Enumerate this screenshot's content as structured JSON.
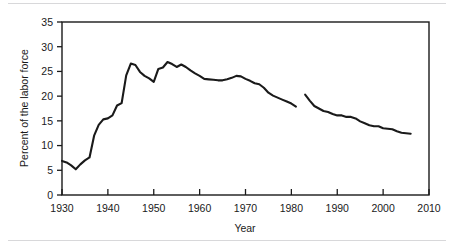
{
  "chart_data": {
    "type": "line",
    "title": "",
    "xlabel": "Year",
    "ylabel": "Percent of the labor force",
    "xlim": [
      1930,
      2010
    ],
    "ylim": [
      0,
      35
    ],
    "grid": false,
    "legend": "none",
    "xticks": [
      1930,
      1940,
      1950,
      1960,
      1970,
      1980,
      1990,
      2000,
      2010
    ],
    "yticks": [
      0,
      5,
      10,
      15,
      20,
      25,
      30,
      35
    ],
    "xtick_labels": [
      "1930",
      "1940",
      "1950",
      "1960",
      "1970",
      "1980",
      "1990",
      "2000",
      "2010"
    ],
    "ytick_labels": [
      "0",
      "5",
      "10",
      "15",
      "20",
      "25",
      "30",
      "35"
    ],
    "line_color": "#1a1a1a",
    "line_width": 2.1,
    "series": [
      {
        "name": "segment-1",
        "x": [
          1930,
          1931,
          1932,
          1933,
          1934,
          1935,
          1936,
          1937,
          1938,
          1939,
          1940,
          1941,
          1942,
          1943,
          1944,
          1945,
          1946,
          1947,
          1948,
          1949,
          1950,
          1951,
          1952,
          1953,
          1954,
          1955,
          1956,
          1957,
          1958,
          1959,
          1960,
          1961,
          1962,
          1963,
          1964,
          1965,
          1966,
          1967,
          1968,
          1969,
          1970,
          1971,
          1972,
          1973,
          1974,
          1975,
          1976,
          1977,
          1978,
          1979,
          1980,
          1981
        ],
        "y": [
          6.9,
          6.6,
          6.0,
          5.2,
          6.2,
          7.0,
          7.6,
          12.0,
          14.2,
          15.3,
          15.5,
          16.1,
          18.1,
          18.6,
          24.2,
          26.6,
          26.3,
          24.9,
          24.1,
          23.6,
          22.9,
          25.5,
          25.8,
          26.9,
          26.5,
          25.9,
          26.4,
          25.9,
          25.2,
          24.6,
          24.1,
          23.5,
          23.4,
          23.3,
          23.2,
          23.2,
          23.4,
          23.7,
          24.1,
          24.0,
          23.5,
          23.1,
          22.6,
          22.4,
          21.7,
          20.7,
          20.1,
          19.7,
          19.3,
          18.9,
          18.5,
          17.9
        ]
      },
      {
        "name": "segment-2",
        "x": [
          1983,
          1984,
          1985,
          1986,
          1987,
          1988,
          1989,
          1990,
          1991,
          1992,
          1993,
          1994,
          1995,
          1996,
          1997,
          1998,
          1999,
          2000,
          2001,
          2002,
          2003,
          2004,
          2005,
          2006
        ],
        "y": [
          20.3,
          19.1,
          18.0,
          17.5,
          17.0,
          16.8,
          16.4,
          16.1,
          16.1,
          15.8,
          15.8,
          15.5,
          14.9,
          14.5,
          14.1,
          13.9,
          13.9,
          13.5,
          13.4,
          13.3,
          12.9,
          12.6,
          12.5,
          12.4
        ]
      }
    ]
  },
  "axes": {
    "x_title": "Year",
    "y_title": "Percent of the labor force"
  }
}
